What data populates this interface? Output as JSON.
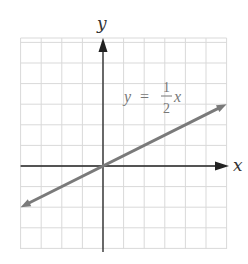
{
  "chart_data": {
    "type": "line",
    "title": "",
    "xlabel": "x",
    "ylabel": "y",
    "xlim": [
      -4,
      6
    ],
    "ylim": [
      -4,
      6
    ],
    "grid": true,
    "grid_step": 1,
    "tick_labels": false,
    "series": [
      {
        "name": "y = 1/2 x",
        "equation": "y = (1/2)x",
        "slope": 0.5,
        "intercept": 0,
        "x": [
          -4,
          6
        ],
        "y": [
          -2,
          3
        ],
        "arrows_both_ends": true,
        "color": "#7a7a7a"
      }
    ],
    "annotations": [
      {
        "text": "y = 1/2 x",
        "position": [
          3.2,
          4.1
        ]
      }
    ]
  },
  "labels": {
    "x_axis": "x",
    "y_axis": "y",
    "equation_lhs": "y",
    "equation_eq": "=",
    "equation_num": "1",
    "equation_den": "2",
    "equation_var": "x"
  },
  "colors": {
    "grid": "#d9d9d9",
    "axes": "#222222",
    "line": "#7a7a7a",
    "equation": "#777777"
  }
}
